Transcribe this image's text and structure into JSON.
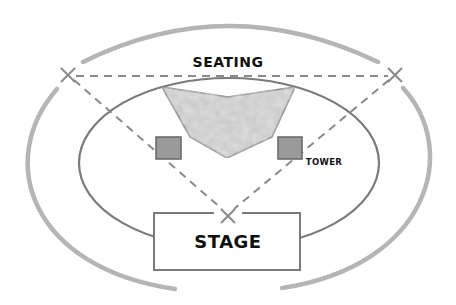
{
  "diagram": {
    "type": "venue-layout",
    "labels": {
      "seating": "SEATING",
      "tower": "TOWER",
      "stage": "STAGE"
    },
    "colors": {
      "outer_ring": "#b5b5b5",
      "inner_ellipse": "#7a7a7a",
      "dashed_lines": "#8a8a8a",
      "seating_fill": "#c4c4c4",
      "seating_stroke": "#7a7a7a",
      "tower_fill": "#9a9a9a",
      "tower_stroke": "#666666",
      "stage_stroke": "#7a7a7a",
      "text": "#111111"
    },
    "elements": {
      "outer_ring": "Outer boundary ring",
      "inner_ellipse": "Inner field ellipse",
      "seating_area": "Seating area polygon",
      "towers": [
        "Left tower",
        "Right tower"
      ],
      "x_marks": [
        "Left X mark",
        "Right X mark",
        "Stage X mark"
      ],
      "stage": "Stage"
    }
  }
}
